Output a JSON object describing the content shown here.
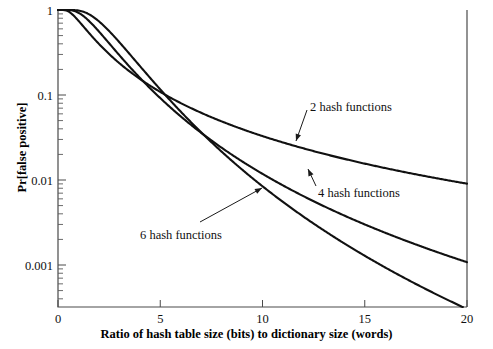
{
  "chart_data": {
    "type": "line",
    "title": "",
    "xlabel": "Ratio of hash table size (bits) to dictionary size (words)",
    "ylabel": "Pr[false positive]",
    "xlim": [
      0,
      20
    ],
    "ylim": [
      0.00025,
      1
    ],
    "yscale": "log",
    "grid": false,
    "legend_position": "inline-annotations",
    "xticks": [
      "0",
      "5",
      "10",
      "15",
      "20"
    ],
    "xtick_values": [
      0,
      5,
      10,
      15,
      20
    ],
    "yticks": [
      "1",
      "0.1",
      "0.01",
      "0.001"
    ],
    "ytick_values": [
      1,
      0.1,
      0.01,
      0.001
    ],
    "annotations": [
      {
        "label": "2 hash functions",
        "x": 12.2,
        "y": 0.082
      },
      {
        "label": "4 hash functions",
        "x": 12.0,
        "y": 0.0125
      },
      {
        "label": "6 hash functions",
        "x": 5.1,
        "y": 0.0032
      }
    ],
    "series": [
      {
        "name": "2 hash functions",
        "k": 2,
        "x": [
          0,
          0.5,
          1,
          1.5,
          2,
          2.5,
          3,
          4,
          5,
          6,
          7,
          8,
          9,
          10,
          11,
          12,
          13,
          14,
          15,
          16,
          17,
          18,
          19,
          20
        ],
        "values": [
          1.0,
          0.985,
          0.93,
          0.845,
          0.748,
          0.652,
          0.563,
          0.412,
          0.301,
          0.222,
          0.166,
          0.125,
          0.0956,
          0.0739,
          0.0578,
          0.0456,
          0.0363,
          0.0292,
          0.0236,
          0.0192,
          0.0158,
          0.0131,
          0.0109,
          0.0091
        ]
      },
      {
        "name": "4 hash functions",
        "k": 4,
        "x": [
          0,
          0.5,
          1,
          1.5,
          2,
          2.5,
          3,
          4,
          5,
          6,
          7,
          8,
          9,
          10,
          11,
          12,
          13,
          14,
          15,
          16,
          17,
          18,
          19,
          20
        ],
        "values": [
          1.0,
          1.0,
          0.985,
          0.93,
          0.843,
          0.738,
          0.63,
          0.437,
          0.292,
          0.193,
          0.127,
          0.084,
          0.0561,
          0.038,
          0.0261,
          0.0182,
          0.0129,
          0.0093,
          0.00679,
          0.00503,
          0.00378,
          0.00287,
          0.00221,
          0.00171
        ]
      },
      {
        "name": "6 hash functions",
        "k": 6,
        "x": [
          0,
          0.5,
          1,
          1.5,
          2,
          2.5,
          3,
          4,
          5,
          6,
          7,
          8,
          9,
          10,
          11,
          12,
          13,
          14,
          15,
          16,
          17,
          18,
          19,
          20
        ],
        "values": [
          1.0,
          1.0,
          0.998,
          0.982,
          0.936,
          0.859,
          0.762,
          0.561,
          0.382,
          0.25,
          0.16,
          0.101,
          0.0638,
          0.0405,
          0.0259,
          0.0168,
          0.011,
          0.0073,
          0.0049,
          0.00333,
          0.00229,
          0.00159,
          0.00112,
          0.00079
        ]
      }
    ]
  },
  "axes": {
    "left_px": 58,
    "right_px": 467,
    "top_px": 10,
    "bottom_px": 307
  }
}
